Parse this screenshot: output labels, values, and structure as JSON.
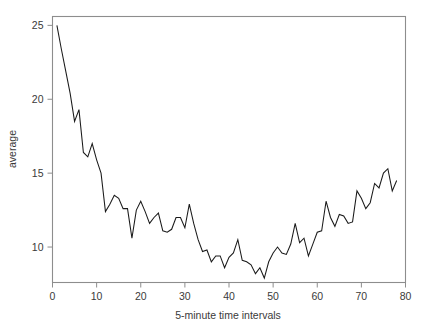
{
  "chart_data": {
    "type": "line",
    "title": "",
    "xlabel": "5-minute time intervals",
    "ylabel": "average",
    "xlim": [
      0,
      80
    ],
    "ylim": [
      7.6,
      25.6
    ],
    "xticks": [
      0,
      10,
      20,
      30,
      40,
      50,
      60,
      70,
      80
    ],
    "xticklabels": [
      "0",
      "10",
      "20",
      "30",
      "40",
      "50",
      "60",
      "70",
      "80"
    ],
    "yticks": [
      10,
      15,
      20,
      25
    ],
    "yticklabels": [
      "10",
      "15",
      "20",
      "25"
    ],
    "grid": false,
    "legend": null,
    "frame": "box",
    "line_color": "#1a1a1a",
    "series": [
      {
        "name": "average",
        "x": [
          1,
          2,
          3,
          4,
          5,
          6,
          7,
          8,
          9,
          10,
          11,
          12,
          13,
          14,
          15,
          16,
          17,
          18,
          19,
          20,
          21,
          22,
          23,
          24,
          25,
          26,
          27,
          28,
          29,
          30,
          31,
          32,
          33,
          34,
          35,
          36,
          37,
          38,
          39,
          40,
          41,
          42,
          43,
          44,
          45,
          46,
          47,
          48,
          49,
          50,
          51,
          52,
          53,
          54,
          55,
          56,
          57,
          58,
          59,
          60,
          61,
          62,
          63,
          64,
          65,
          66,
          67,
          68,
          69,
          70,
          71,
          72,
          73,
          74,
          75,
          76,
          77,
          78
        ],
        "values": [
          25.0,
          23.4,
          21.9,
          20.4,
          18.5,
          19.3,
          16.4,
          16.1,
          17.0,
          15.9,
          15.0,
          12.4,
          12.9,
          13.5,
          13.3,
          12.6,
          12.6,
          10.6,
          12.5,
          13.1,
          12.4,
          11.6,
          12.0,
          12.3,
          11.1,
          11.0,
          11.2,
          12.0,
          12.0,
          11.3,
          12.9,
          11.6,
          10.5,
          9.7,
          9.8,
          9.0,
          9.4,
          9.4,
          8.6,
          9.3,
          9.6,
          10.5,
          9.1,
          9.0,
          8.8,
          8.2,
          8.6,
          7.9,
          9.0,
          9.6,
          10.0,
          9.6,
          9.5,
          10.2,
          11.6,
          10.3,
          10.6,
          9.4,
          10.2,
          11.0,
          11.1,
          13.1,
          12.0,
          11.4,
          12.2,
          12.1,
          11.6,
          11.7,
          13.8,
          13.3,
          12.6,
          13.0,
          14.3,
          14.0,
          15.0,
          15.3,
          13.8,
          14.5
        ]
      }
    ]
  },
  "axis": {
    "x_title": "5-minute time intervals",
    "y_title": "average"
  }
}
